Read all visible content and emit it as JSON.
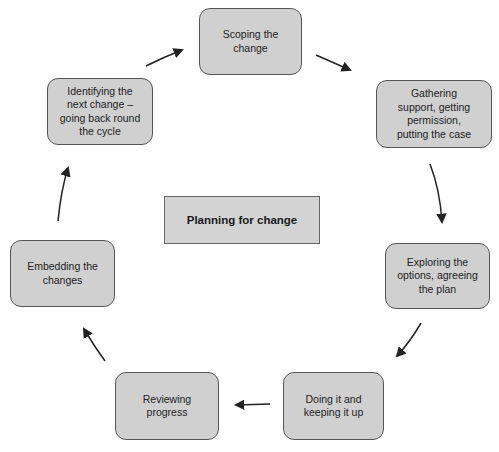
{
  "diagram": {
    "type": "cycle",
    "center_label": "Planning for change",
    "nodes": [
      {
        "id": "scoping",
        "label": "Scoping the\nchange"
      },
      {
        "id": "gathering",
        "label": "Gathering\nsupport, getting\npermission,\nputting the case"
      },
      {
        "id": "exploring",
        "label": "Exploring the\noptions, agreeing\nthe plan"
      },
      {
        "id": "doing",
        "label": "Doing it and\nkeeping it up"
      },
      {
        "id": "reviewing",
        "label": "Reviewing\nprogress"
      },
      {
        "id": "embedding",
        "label": "Embedding the\nchanges"
      },
      {
        "id": "identifying",
        "label": "Identifying the\nnext change –\ngoing back round\nthe cycle"
      }
    ],
    "edges": [
      {
        "from": "scoping",
        "to": "gathering"
      },
      {
        "from": "gathering",
        "to": "exploring"
      },
      {
        "from": "exploring",
        "to": "doing"
      },
      {
        "from": "doing",
        "to": "reviewing"
      },
      {
        "from": "reviewing",
        "to": "embedding"
      },
      {
        "from": "embedding",
        "to": "identifying"
      },
      {
        "from": "identifying",
        "to": "scoping"
      }
    ],
    "colors": {
      "box_fill": "#d0d0d0",
      "box_border": "#555555",
      "arrow": "#222222",
      "text": "#222222"
    }
  }
}
